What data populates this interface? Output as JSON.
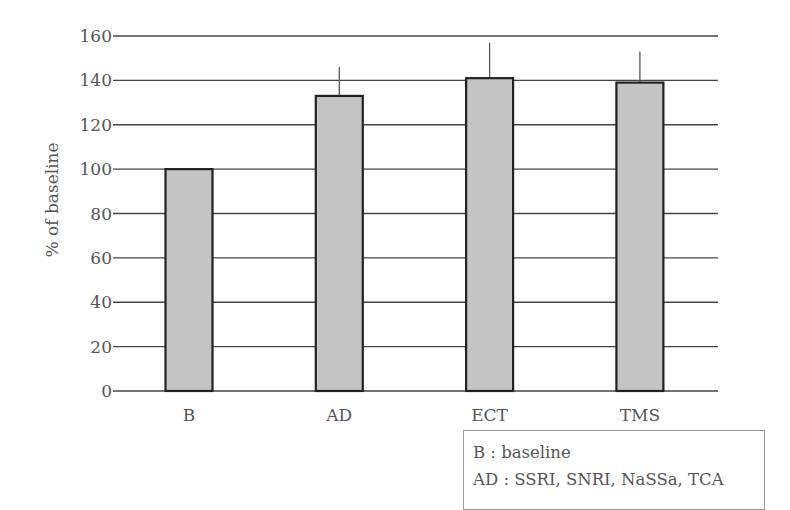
{
  "chart_data": {
    "type": "bar",
    "title": "",
    "xlabel": "",
    "ylabel": "% of baseline",
    "ylim": [
      0,
      160
    ],
    "yticks": [
      0,
      20,
      40,
      60,
      80,
      100,
      120,
      140,
      160
    ],
    "grid": true,
    "categories": [
      "B",
      "AD",
      "ECT",
      "TMS"
    ],
    "values": [
      100,
      133,
      141,
      139
    ],
    "error_upper": [
      0,
      13,
      16,
      14
    ],
    "bar_color": "#c4c4c4",
    "legend": {
      "placement": "bottom-right",
      "entries": [
        "B : baseline",
        "AD : SSRI, SNRI, NaSSa, TCA"
      ]
    }
  }
}
